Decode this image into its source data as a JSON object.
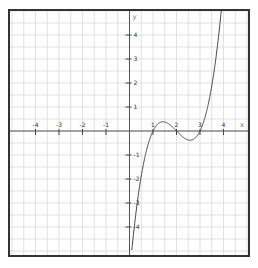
{
  "chart_data": {
    "type": "line",
    "title": "",
    "function": "y = (x-1)(x-2)(x-3)",
    "xlabel": "x",
    "ylabel": "y",
    "xlim": [
      -5,
      5
    ],
    "ylim": [
      -5,
      5
    ],
    "grid": true,
    "grid_step": 0.5,
    "x_ticks": [
      -4,
      -3,
      -2,
      -1,
      1,
      2,
      3,
      4
    ],
    "x_tick_labels": [
      "-4",
      "-3",
      "-2",
      "-1",
      "1",
      "2",
      "3",
      "4"
    ],
    "y_ticks": [
      4,
      3,
      2,
      1,
      -1,
      -2,
      -3,
      -4
    ],
    "y_tick_labels": [
      "4",
      "3",
      "2",
      "1",
      "-1",
      "-2",
      "-3",
      "-4"
    ],
    "series": [
      {
        "name": "f(x)",
        "x": [
          0.1,
          0.5,
          1.0,
          1.42,
          2.0,
          2.58,
          3.0,
          3.5,
          3.89
        ],
        "values": [
          -4.96,
          -1.88,
          0.0,
          0.38,
          0.0,
          -0.38,
          0.0,
          1.88,
          4.86
        ]
      }
    ],
    "roots": [
      1,
      2,
      3
    ],
    "local_max": [
      1.42,
      0.38
    ],
    "local_min": [
      2.58,
      -0.38
    ]
  },
  "colors": {
    "grid": "#d9d9d9",
    "axis": "#555555",
    "curve": "#444444",
    "frame": "#333333"
  }
}
